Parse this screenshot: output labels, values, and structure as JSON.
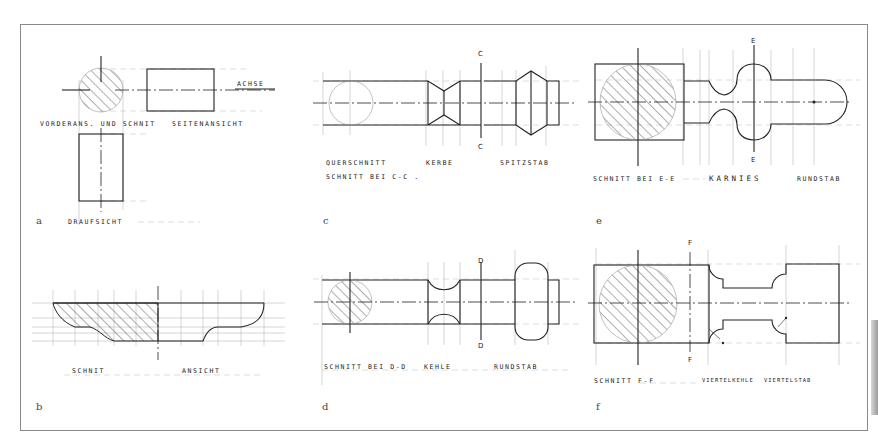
{
  "figure": {
    "panels": [
      {
        "id": "a",
        "letter": "a",
        "labels": {
          "axis": "ACHSE",
          "front_view_section": "VORDERANS. UND SCHNIT",
          "side_view": "SEITENANSICHT",
          "top_view": "DRAUFSICHT"
        }
      },
      {
        "id": "b",
        "letter": "b",
        "labels": {
          "section": "SCHNIT",
          "view": "ANSICHT"
        }
      },
      {
        "id": "c",
        "letter": "c",
        "labels": {
          "cut_mark_top": "C",
          "cut_mark_bottom": "C",
          "cross_section": "QUERSCHNITT",
          "notch": "KERBE",
          "pointed_bar": "SPITZSTAB",
          "section_at": "SCHNITT BEI C-C ."
        }
      },
      {
        "id": "d",
        "letter": "d",
        "labels": {
          "cut_mark_top": "D",
          "cut_mark_bottom": "D",
          "section_at": "SCHNITT BEI D-D",
          "cove": "KEHLE",
          "round_bar": "RUNDSTAB"
        }
      },
      {
        "id": "e",
        "letter": "e",
        "labels": {
          "cut_mark_top": "E",
          "cut_mark_bottom": "E",
          "section_at": "SCHNITT BEI E-E",
          "ogee": "KARNIES",
          "round_bar": "RUNDSTAB"
        }
      },
      {
        "id": "f",
        "letter": "f",
        "labels": {
          "cut_mark_top": "F",
          "cut_mark_bottom": "F",
          "section_at": "SCHNITT F-F",
          "quarter_cove": "VIERTELKEHLE",
          "quarter_round": "VIERTELSTAB"
        }
      }
    ]
  }
}
